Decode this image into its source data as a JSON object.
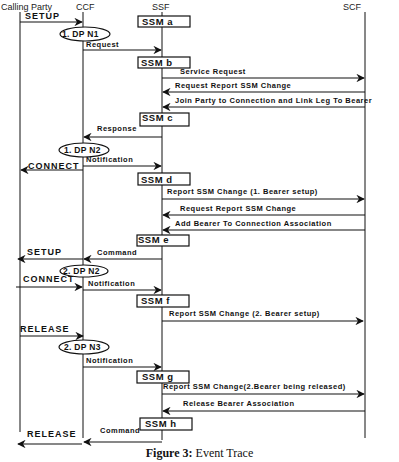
{
  "lifelines": {
    "calling_party": "Calling Party",
    "ccf": "CCF",
    "ssf": "SSF",
    "scf": "SCF"
  },
  "ssm_boxes": [
    "SSM a",
    "SSM b",
    "SSM c",
    "SSM d",
    "SSM e",
    "SSM f",
    "SSM g",
    "SSM h"
  ],
  "dp_ovals": [
    "1. DP N1",
    "1. DP N2",
    "2. DP N2",
    "2. DP N3"
  ],
  "messages": {
    "setup_1": "SETUP",
    "request": "Request",
    "service_request": "Service Request",
    "request_report_1": "Request Report SSM Change",
    "join_party": "Join Party to Connection and Link Leg To Bearer",
    "response": "Response",
    "notification_1": "Notification",
    "connect_1": "CONNECT",
    "report_change_1": "Report SSM Change (1. Bearer setup)",
    "request_report_2": "Request Report SSM Change",
    "add_bearer": "Add Bearer To Connection Association",
    "setup_2": "SETUP",
    "command_1": "Command",
    "connect_2": "CONNECT",
    "notification_2": "Notification",
    "report_change_2": "Report SSM Change (2. Bearer setup)",
    "release_1": "RELEASE",
    "notification_3": "Notification",
    "report_change_3": "Report SSM Change(2.Bearer being released)",
    "release_bearer": "Release Bearer Association",
    "release_2": "RELEASE",
    "command_2": "Command"
  },
  "caption": {
    "figure_label": "Figure 3:",
    "figure_title": " Event Trace"
  }
}
